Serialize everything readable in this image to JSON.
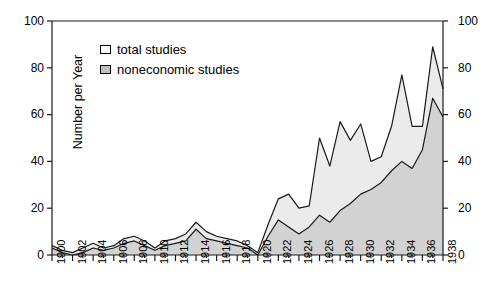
{
  "chart_data": {
    "type": "area",
    "title": "",
    "xlabel": "",
    "ylabel": "Number per Year",
    "xlim": [
      1900,
      1938
    ],
    "ylim": [
      0,
      100
    ],
    "grid": false,
    "legend_position": "upper-left-inside",
    "y_ticks": [
      "0",
      "20",
      "40",
      "60",
      "80",
      "100"
    ],
    "y_ticks_right": [
      "0",
      "20",
      "40",
      "60",
      "80",
      "100"
    ],
    "x_ticks": [
      "1900",
      "1902",
      "1904",
      "1906",
      "1908",
      "1910",
      "1912",
      "1914",
      "1916",
      "1918",
      "1920",
      "1922",
      "1924",
      "1926",
      "1928",
      "1930",
      "1932",
      "1934",
      "1936",
      "1938"
    ],
    "x": [
      1900,
      1901,
      1902,
      1903,
      1904,
      1905,
      1906,
      1907,
      1908,
      1909,
      1910,
      1911,
      1912,
      1913,
      1914,
      1915,
      1916,
      1917,
      1918,
      1919,
      1920,
      1921,
      1922,
      1923,
      1924,
      1925,
      1926,
      1927,
      1928,
      1929,
      1930,
      1931,
      1932,
      1933,
      1934,
      1935,
      1936,
      1937,
      1938
    ],
    "series": [
      {
        "name": "total studies",
        "fill": "#ebebeb",
        "values": [
          4,
          2,
          1,
          3,
          5,
          3,
          4,
          7,
          8,
          6,
          3,
          6,
          7,
          9,
          14,
          10,
          8,
          7,
          6,
          4,
          1,
          13,
          24,
          26,
          20,
          21,
          50,
          38,
          57,
          49,
          56,
          40,
          42,
          55,
          77,
          55,
          55,
          89,
          71
        ]
      },
      {
        "name": "noneconomic studies",
        "fill": "#d2d2d2",
        "values": [
          3,
          1,
          0,
          1,
          3,
          2,
          3,
          5,
          6,
          4,
          2,
          4,
          5,
          6,
          11,
          7,
          6,
          5,
          4,
          3,
          0,
          8,
          15,
          12,
          9,
          12,
          17,
          14,
          19,
          22,
          26,
          28,
          31,
          36,
          40,
          37,
          45,
          67,
          59
        ]
      }
    ],
    "legend": [
      {
        "label": "total studies",
        "swatch": "white"
      },
      {
        "label": "noneconomic studies",
        "swatch": "gray"
      }
    ]
  },
  "colors": {
    "line": "#1a1a1a",
    "total_fill": "#ebebeb",
    "noneconomic_fill": "#d2d2d2",
    "axis": "#1a1a1a"
  }
}
